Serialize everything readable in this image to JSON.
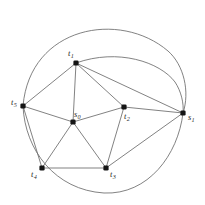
{
  "figure": {
    "type": "graph-diagram",
    "title": "",
    "background_color": "#ffffff",
    "edge_color": "#6b6b6b",
    "vertex_color": "#151515",
    "label_color": "#2b2b2b"
  },
  "vertices": [
    {
      "id": "t1",
      "base": "t",
      "sub": "1",
      "x": 76,
      "y": 63,
      "label_x": 68,
      "label_y": 49
    },
    {
      "id": "t2",
      "base": "t",
      "sub": "2",
      "x": 124,
      "y": 107,
      "label_x": 124,
      "label_y": 112
    },
    {
      "id": "t3",
      "base": "t",
      "sub": "3",
      "x": 106,
      "y": 168,
      "label_x": 110,
      "label_y": 170
    },
    {
      "id": "t4",
      "base": "t",
      "sub": "4",
      "x": 42,
      "y": 168,
      "label_x": 31,
      "label_y": 170
    },
    {
      "id": "t5",
      "base": "t",
      "sub": "5",
      "x": 23,
      "y": 106,
      "label_x": 11,
      "label_y": 98
    },
    {
      "id": "s0",
      "base": "s",
      "sub": "0",
      "x": 73,
      "y": 122,
      "label_x": 74,
      "label_y": 110
    },
    {
      "id": "s1",
      "base": "s",
      "sub": "1",
      "x": 183,
      "y": 113,
      "label_x": 188,
      "label_y": 113
    }
  ],
  "straight_edges": [
    {
      "from": "t5",
      "to": "t1"
    },
    {
      "from": "t5",
      "to": "s0"
    },
    {
      "from": "t5",
      "to": "t4"
    },
    {
      "from": "t1",
      "to": "s0"
    },
    {
      "from": "t1",
      "to": "t2"
    },
    {
      "from": "t1",
      "to": "s1"
    },
    {
      "from": "s0",
      "to": "t2"
    },
    {
      "from": "s0",
      "to": "t4"
    },
    {
      "from": "s0",
      "to": "t3"
    },
    {
      "from": "t2",
      "to": "s1"
    },
    {
      "from": "t2",
      "to": "t3"
    },
    {
      "from": "t4",
      "to": "t3"
    },
    {
      "from": "t3",
      "to": "s1"
    }
  ],
  "curved_edges": [
    {
      "from": "t5",
      "to": "s1",
      "label": "outer-top-arc",
      "path": "M 23 106 C 30 26 120 10 168 51 C 184 65 190 92 183 113"
    },
    {
      "from": "t1",
      "to": "s1",
      "label": "inner-top-arc",
      "path": "M 76 63 C 118 48 160 62 175 82 C 181 91 184 103 183 113"
    },
    {
      "from": "t5",
      "to": "s1",
      "label": "outer-bottom-arc",
      "path": "M 23 106 C 25 150 55 190 104 193 C 148 195 178 155 183 113"
    }
  ]
}
